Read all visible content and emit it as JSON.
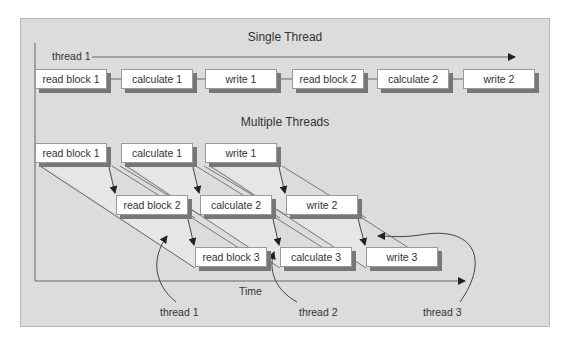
{
  "single_thread": {
    "title": "Single Thread",
    "thread_label": "thread 1",
    "steps": [
      "read block 1",
      "calculate 1",
      "write 1",
      "read block 2",
      "calculate 2",
      "write 2"
    ]
  },
  "multiple_threads": {
    "title": "Multiple Threads",
    "rows": [
      [
        "read block 1",
        "calculate 1",
        "write 1"
      ],
      [
        "read block 2",
        "calculate 2",
        "write 2"
      ],
      [
        "read block 3",
        "calculate 3",
        "write 3"
      ]
    ],
    "thread_labels": [
      "thread 1",
      "thread 2",
      "thread 3"
    ]
  },
  "axis": {
    "x_label": "Time"
  },
  "colors": {
    "panel": "#dcdcdc",
    "box": "#ffffff",
    "shadow": "#777777",
    "line": "#555555",
    "band": "#eeeeee"
  }
}
